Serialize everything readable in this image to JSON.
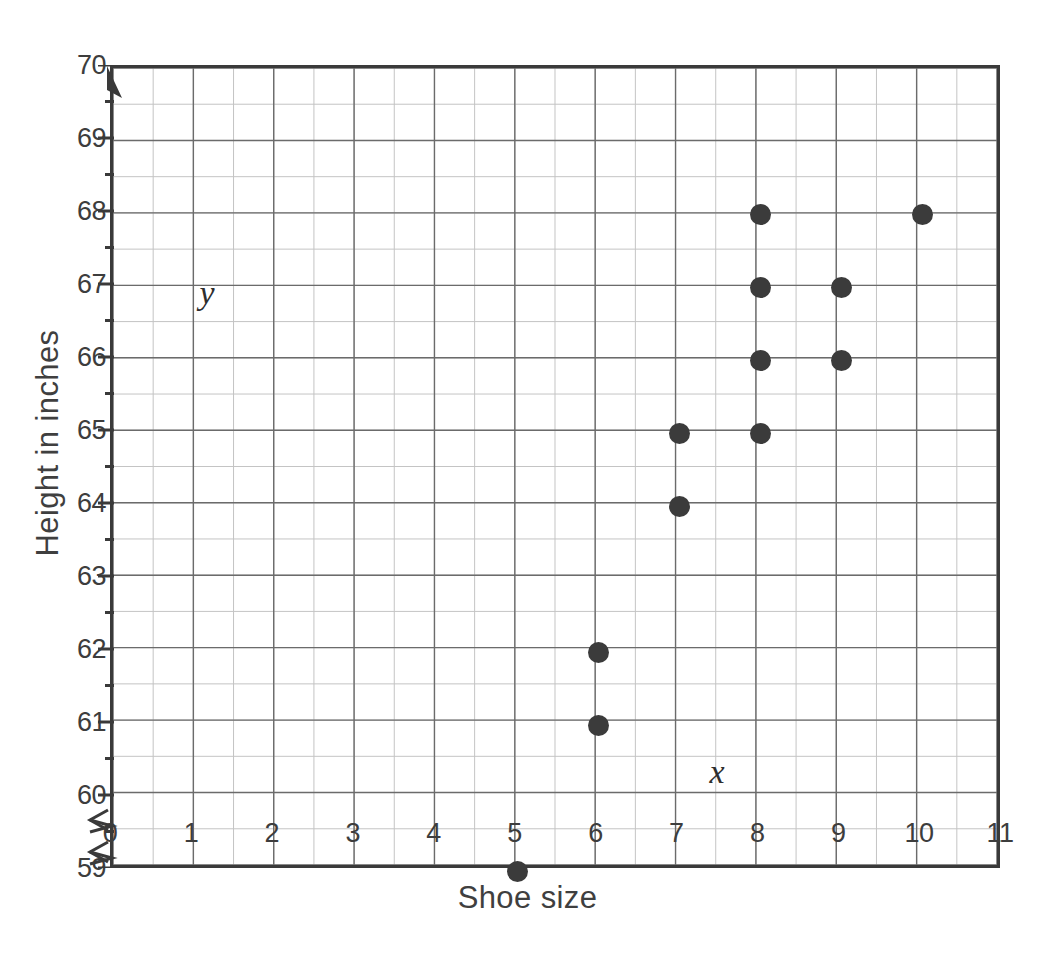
{
  "chart_data": {
    "type": "scatter",
    "title": "",
    "xlabel": "Shoe size",
    "ylabel": "Height in inches",
    "x_var_label": "x",
    "y_var_label": "y",
    "xlim": [
      0,
      11
    ],
    "ylim": [
      59,
      70
    ],
    "grid": true,
    "minor_grid": true,
    "x_major_step": 1,
    "y_major_step": 1,
    "x_minor_step": 0.5,
    "y_minor_step": 0.5,
    "axis_break": true,
    "legend": "none",
    "xticks": [
      "0",
      "1",
      "2",
      "3",
      "4",
      "5",
      "6",
      "7",
      "8",
      "9",
      "10",
      "11"
    ],
    "yticks": [
      "59",
      "60",
      "61",
      "62",
      "63",
      "64",
      "65",
      "66",
      "67",
      "68",
      "69",
      "70"
    ],
    "points": [
      {
        "x": 5,
        "y": 59
      },
      {
        "x": 6,
        "y": 61
      },
      {
        "x": 6,
        "y": 62
      },
      {
        "x": 7,
        "y": 64
      },
      {
        "x": 7,
        "y": 65
      },
      {
        "x": 8,
        "y": 65
      },
      {
        "x": 8,
        "y": 66
      },
      {
        "x": 8,
        "y": 67
      },
      {
        "x": 8,
        "y": 68
      },
      {
        "x": 9,
        "y": 66
      },
      {
        "x": 9,
        "y": 67
      },
      {
        "x": 10,
        "y": 68
      }
    ],
    "colors": {
      "point": "#3b3b3b",
      "frame": "#3a3a3a",
      "major_grid": "#6b6b6b",
      "minor_grid": "#c4c4c4",
      "text": "#3d3d3d",
      "background": "#ffffff"
    }
  }
}
